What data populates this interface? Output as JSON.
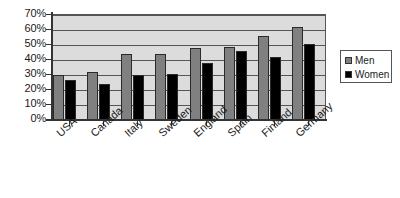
{
  "chart_data": {
    "type": "bar",
    "title": "",
    "xlabel": "",
    "ylabel": "",
    "ylim": [
      0,
      70
    ],
    "grid": true,
    "legend_position": "right",
    "categories": [
      "USA",
      "Canada",
      "Italy",
      "Sweden",
      "England",
      "Spain",
      "Finland",
      "Germany"
    ],
    "y_ticks": [
      "0%",
      "10%",
      "20%",
      "30%",
      "40%",
      "50%",
      "60%",
      "70%"
    ],
    "y_tick_values": [
      0,
      10,
      20,
      30,
      40,
      50,
      60,
      70
    ],
    "series": [
      {
        "name": "Men",
        "color": "#808080",
        "values": [
          30,
          32,
          44,
          44,
          48,
          49,
          56,
          62
        ]
      },
      {
        "name": "Women",
        "color": "#000000",
        "values": [
          27,
          24,
          30,
          31,
          38,
          46,
          42,
          51
        ]
      }
    ]
  },
  "legend": {
    "entries": [
      {
        "label": "Men"
      },
      {
        "label": "Women"
      }
    ]
  }
}
